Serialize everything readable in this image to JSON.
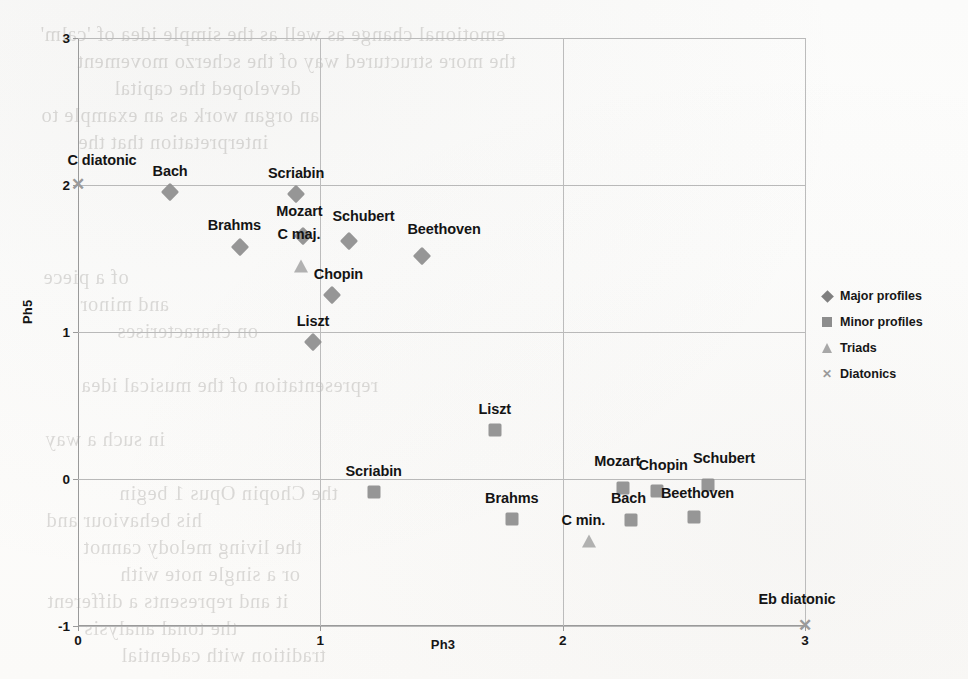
{
  "chart_data": {
    "type": "scatter",
    "title": "",
    "xlabel": "Ph3",
    "ylabel": "Ph5",
    "xlim": [
      0,
      3
    ],
    "ylim": [
      -1,
      3
    ],
    "xticks": [
      "0",
      "1",
      "2",
      "3"
    ],
    "yticks": [
      "-1",
      "0",
      "1",
      "2",
      "3"
    ],
    "grid": true,
    "legend_position": "right",
    "series": [
      {
        "name": "Major profiles",
        "marker": "diamond",
        "color": "#8d8d8d",
        "points": [
          {
            "label": "Bach",
            "x": 0.38,
            "y": 1.95
          },
          {
            "label": "Scriabin",
            "x": 0.9,
            "y": 1.94
          },
          {
            "label": "Brahms",
            "x": 0.67,
            "y": 1.58
          },
          {
            "label": "Mozart",
            "x": 0.93,
            "y": 1.65
          },
          {
            "label": "Schubert",
            "x": 1.12,
            "y": 1.62
          },
          {
            "label": "Beethoven",
            "x": 1.42,
            "y": 1.52
          },
          {
            "label": "Chopin",
            "x": 1.05,
            "y": 1.25
          },
          {
            "label": "Liszt",
            "x": 0.97,
            "y": 0.93
          }
        ]
      },
      {
        "name": "Minor profiles",
        "marker": "square",
        "color": "#8d8d8d",
        "points": [
          {
            "label": "Liszt",
            "x": 1.72,
            "y": 0.33
          },
          {
            "label": "Scriabin",
            "x": 1.22,
            "y": -0.09
          },
          {
            "label": "Brahms",
            "x": 1.79,
            "y": -0.27
          },
          {
            "label": "Mozart",
            "x": 2.25,
            "y": -0.06
          },
          {
            "label": "Chopin",
            "x": 2.39,
            "y": -0.08
          },
          {
            "label": "Schubert",
            "x": 2.6,
            "y": -0.04
          },
          {
            "label": "Bach",
            "x": 2.28,
            "y": -0.28
          },
          {
            "label": "Beethoven",
            "x": 2.54,
            "y": -0.26
          }
        ]
      },
      {
        "name": "Triads",
        "marker": "triangle",
        "color": "#a9a9a9",
        "points": [
          {
            "label": "C maj.",
            "x": 0.92,
            "y": 1.45
          },
          {
            "label": "C min.",
            "x": 2.11,
            "y": -0.42
          }
        ]
      },
      {
        "name": "Diatonics",
        "marker": "cross",
        "color": "#9a9a9a",
        "points": [
          {
            "label": "C diatonic",
            "x": 0.0,
            "y": 2.0
          },
          {
            "label": "Eb diatonic",
            "x": 3.0,
            "y": -1.0
          }
        ]
      }
    ]
  },
  "legend": {
    "items": [
      {
        "label": "Major profiles",
        "marker": "diamond-icon"
      },
      {
        "label": "Minor profiles",
        "marker": "square-icon"
      },
      {
        "label": "Triads",
        "marker": "triangle-icon"
      },
      {
        "label": "Diatonics",
        "marker": "cross-icon"
      }
    ]
  },
  "background_text": {
    "lines": [
      "emotional change as well as the simple idea of 'calm'",
      "the more structured way of the scherzo movement",
      "developed the capital",
      "an organ work as an example to",
      "interpretation that the",
      "",
      "",
      "",
      "",
      "of a piece",
      "and minor",
      "on characterises",
      "",
      "representation of the musical idea",
      "",
      "in such a way",
      "",
      "the Chopin Opus 1 begin",
      "his behaviour and",
      "the living melody cannot",
      "or a single note with",
      "it and represents a different",
      "the tonal analysis",
      "tradition with cadential"
    ]
  }
}
